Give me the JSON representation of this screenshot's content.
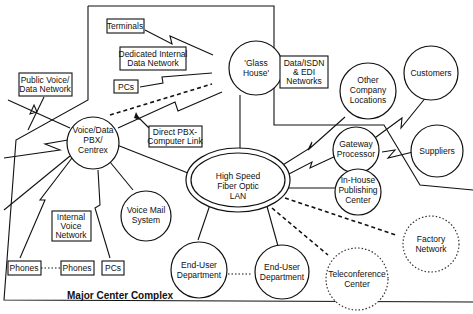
{
  "diagram": {
    "complex_label": "Major Center Complex",
    "nodes": {
      "glass_house": [
        "'Glass",
        "House'"
      ],
      "pbx": [
        "Voice/Data",
        "PBX/",
        "Centrex"
      ],
      "lan": [
        "High Speed",
        "Fiber Optic",
        "LAN"
      ],
      "voice_mail": [
        "Voice Mail",
        "System"
      ],
      "end_user_1": [
        "End-User",
        "Department"
      ],
      "end_user_2": [
        "End-User",
        "Department"
      ],
      "other_company": [
        "Other",
        "Company",
        "Locations"
      ],
      "customers": [
        "Customers"
      ],
      "gateway": [
        "Gateway",
        "Processor"
      ],
      "suppliers": [
        "Suppliers"
      ],
      "publishing": [
        "In-House",
        "Publishing",
        "Center"
      ],
      "factory": [
        "Factory",
        "Network"
      ],
      "teleconference": [
        "Teleconference",
        "Center"
      ]
    },
    "boxes": {
      "terminals": [
        "Terminals"
      ],
      "dedicated": [
        "Dedicated Internal",
        "Data Network"
      ],
      "pcs_top": [
        "PCs"
      ],
      "public": [
        "Public Voice/",
        "Data Network"
      ],
      "direct_link": [
        "Direct PBX-",
        "Computer Link"
      ],
      "data_isdn": [
        "Data/ISDN",
        "& EDI",
        "Networks"
      ],
      "internal_voice": [
        "Internal",
        "Voice",
        "Network"
      ],
      "phones_1": [
        "Phones"
      ],
      "phones_2": [
        "Phones"
      ],
      "pcs_bottom": [
        "PCs"
      ]
    }
  }
}
